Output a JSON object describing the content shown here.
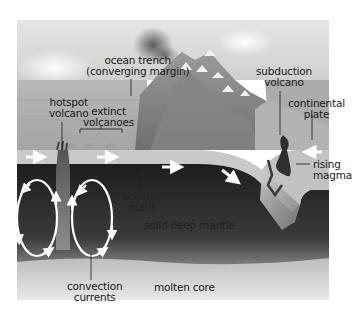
{
  "diagram": {
    "colors": {
      "sky": "#d9d9d9",
      "sea": "#bdbdbd",
      "plate": "#c8c8c8",
      "mantle": "#2a2a2a",
      "core": "#cfcfcf",
      "magma": "#3a3a3a",
      "arrow": "#ffffff"
    },
    "labels": {
      "ocean_trench_line1": "ocean trench",
      "ocean_trench_line2": "(converging margin)",
      "subduction_volcano_line1": "subduction",
      "subduction_volcano_line2": "volcano",
      "hotspot_volcano_line1": "hotspot",
      "hotspot_volcano_line2": "volcano",
      "extinct_volcanoes_line1": "extinct",
      "extinct_volcanoes_line2": "volcanoes",
      "continental_plate_line1": "continental",
      "continental_plate_line2": "plate",
      "rising_magma_line1": "rising",
      "rising_magma_line2": "magma",
      "oceanic_plate_line1": "oceanic",
      "oceanic_plate_line2": "plate",
      "solid_deep_mantle": "solid deep mantle",
      "convection_currents_line1": "convection",
      "convection_currents_line2": "currents",
      "molten_core": "molten core"
    }
  }
}
